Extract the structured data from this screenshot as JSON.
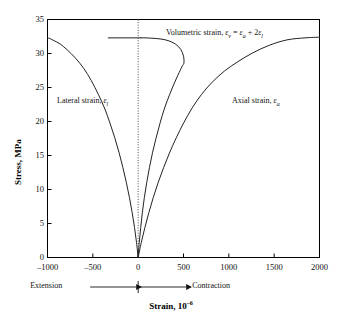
{
  "figure": {
    "name": "stress-strain-curves",
    "background": "#ffffff",
    "line_color": "#222222",
    "axis_color": "#000000",
    "guide_color": "#333333"
  },
  "axes": {
    "y_title": "Stress, MPa",
    "x_title_main": "Strain, 10",
    "x_title_exp": "–6",
    "y_ticks": [
      "0",
      "5",
      "10",
      "15",
      "20",
      "25",
      "30",
      "35"
    ],
    "x_ticks": [
      "–1000",
      "–500",
      "0",
      "500",
      "1000",
      "1500",
      "2000"
    ]
  },
  "direction": {
    "left_label": "Extension",
    "right_label": "Contraction"
  },
  "annotations": {
    "lateral": {
      "text": "Lateral strain, ",
      "sym": "ε",
      "sub": "l"
    },
    "axial": {
      "text": "Axial  strain, ",
      "sym": "ε",
      "sub": "a"
    },
    "volumetric": {
      "text": "Volumetric strain, ",
      "sym1": "ε",
      "sub1": "v",
      "eq": " = ",
      "sym2": "ε",
      "sub2": "a",
      "plus": " + 2",
      "sym3": "ε",
      "sub3": "l"
    }
  },
  "chart_data": {
    "type": "line",
    "title": "",
    "xlabel": "Strain, 10−6",
    "ylabel": "Stress, MPa",
    "xlim": [
      -1000,
      2000
    ],
    "ylim": [
      0,
      35
    ],
    "xticks": [
      -1000,
      -500,
      0,
      500,
      1000,
      1500,
      2000
    ],
    "yticks": [
      0,
      5,
      10,
      15,
      20,
      25,
      30,
      35
    ],
    "grid": false,
    "legend": "inline-annotations",
    "vertical_reference_line": {
      "x": 0,
      "style": "dotted"
    },
    "series": [
      {
        "name": "Lateral strain, ε_l",
        "x": [
          0,
          -18,
          -40,
          -66,
          -96,
          -130,
          -168,
          -210,
          -258,
          -312,
          -372,
          -440,
          -516,
          -600,
          -690,
          -780,
          -860,
          -930,
          -975,
          -1000
        ],
        "y": [
          0,
          2.2,
          4.4,
          6.6,
          8.8,
          11.0,
          13.2,
          15.4,
          17.6,
          19.8,
          22.0,
          24.0,
          26.0,
          27.8,
          29.3,
          30.5,
          31.4,
          31.9,
          32.2,
          32.3
        ]
      },
      {
        "name": "Axial strain, ε_a",
        "x": [
          0,
          34,
          74,
          118,
          166,
          220,
          280,
          346,
          420,
          502,
          596,
          700,
          818,
          950,
          1100,
          1265,
          1445,
          1640,
          1840,
          2000
        ],
        "y": [
          0,
          2.2,
          4.4,
          6.6,
          8.8,
          11.0,
          13.2,
          15.4,
          17.6,
          19.8,
          22.0,
          24.0,
          25.8,
          27.4,
          28.8,
          30.1,
          31.2,
          32.0,
          32.3,
          32.4
        ]
      },
      {
        "name": "Volumetric strain, ε_v = ε_a + 2ε_l",
        "x": [
          0,
          12,
          28,
          46,
          68,
          94,
          124,
          158,
          198,
          242,
          292,
          348,
          404,
          452,
          488,
          505,
          500,
          470,
          410,
          330,
          240,
          150,
          75,
          30
        ],
        "y": [
          0,
          2.2,
          4.4,
          6.6,
          8.8,
          11.0,
          13.2,
          15.4,
          17.6,
          19.8,
          22.0,
          24.0,
          25.8,
          27.2,
          28.2,
          28.6,
          29.6,
          30.6,
          31.4,
          31.9,
          32.15,
          32.25,
          32.3,
          32.3
        ]
      },
      {
        "name": "Volumetric plateau",
        "x": [
          30,
          -330
        ],
        "y": [
          32.3,
          32.3
        ]
      }
    ]
  }
}
